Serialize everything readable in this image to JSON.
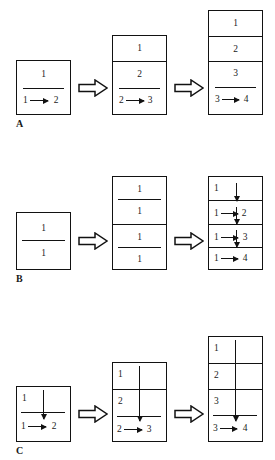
{
  "figure": {
    "type": "diagram",
    "rows": [
      {
        "label": "A",
        "stages": [
          {
            "cells": [
              {
                "top_number": "1",
                "rule": true,
                "transition": {
                  "from": "1",
                  "to": "2"
                }
              }
            ]
          },
          {
            "cells": [
              {
                "top_number": "1",
                "rule": false,
                "transition": null
              },
              {
                "top_number": "2",
                "rule": true,
                "transition": {
                  "from": "2",
                  "to": "3"
                }
              }
            ]
          },
          {
            "cells": [
              {
                "top_number": "1",
                "rule": false,
                "transition": null
              },
              {
                "top_number": "2",
                "rule": false,
                "transition": null
              },
              {
                "top_number": "3",
                "rule": true,
                "transition": {
                  "from": "3",
                  "to": "4"
                }
              }
            ]
          }
        ]
      },
      {
        "label": "B",
        "stages": [
          {
            "cells": [
              {
                "top_number": "1",
                "rule": true,
                "bottom_number": "1"
              }
            ]
          },
          {
            "cells": [
              {
                "top_number": "1",
                "rule": true,
                "bottom_number": "1"
              },
              {
                "top_number": "1",
                "rule": true,
                "bottom_number": "1"
              }
            ]
          },
          {
            "cells": [
              {
                "top_number": "1",
                "down_arrow": true
              },
              {
                "transition": {
                  "from": "1",
                  "to": "2"
                },
                "down_arrow": true
              },
              {
                "transition": {
                  "from": "1",
                  "to": "3"
                },
                "down_arrow": true
              },
              {
                "transition": {
                  "from": "1",
                  "to": "4"
                },
                "down_arrow": false
              }
            ]
          }
        ]
      },
      {
        "label": "C",
        "stages": [
          {
            "cells": [
              {
                "top_number": "1",
                "rule": true,
                "transition": {
                  "from": "1",
                  "to": "2"
                },
                "long_down_arrow": true
              }
            ]
          },
          {
            "cells": [
              {
                "top_number": "1"
              },
              {
                "top_number": "2",
                "rule": true,
                "transition": {
                  "from": "2",
                  "to": "3"
                }
              }
            ],
            "long_down_arrow": true
          },
          {
            "cells": [
              {
                "top_number": "1"
              },
              {
                "top_number": "2"
              },
              {
                "top_number": "3",
                "rule": true,
                "transition": {
                  "from": "3",
                  "to": "4"
                }
              }
            ],
            "long_down_arrow": true
          }
        ]
      }
    ],
    "connector": {
      "name": "block-arrow-right",
      "count": 6
    },
    "colors": {
      "ink": "#121212",
      "background": "#ffffff"
    }
  },
  "labels": {
    "a": "A",
    "b": "B",
    "c": "C"
  },
  "nums": {
    "one": "1",
    "two": "2",
    "three": "3",
    "four": "4"
  }
}
